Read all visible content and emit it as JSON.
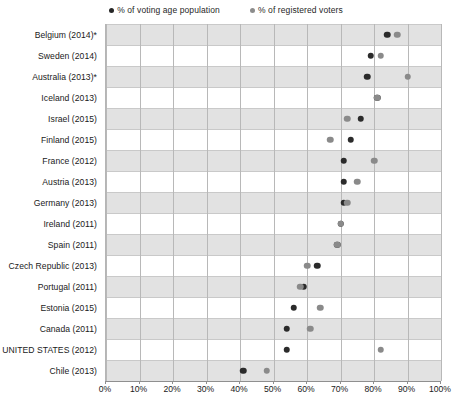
{
  "chart_data": {
    "type": "scatter",
    "title": "",
    "subtitle": "",
    "xlabel": "",
    "ylabel": "",
    "xlim": [
      0,
      100
    ],
    "xticks": [
      "0%",
      "10%",
      "20%",
      "30%",
      "40%",
      "50%",
      "60%",
      "70%",
      "80%",
      "90%",
      "100%"
    ],
    "xtick_values": [
      0,
      10,
      20,
      30,
      40,
      50,
      60,
      70,
      80,
      90,
      100
    ],
    "grid": "vertical",
    "legend_position": "top-center",
    "legend": [
      {
        "name": "% of voting age population",
        "key": "vap",
        "color": "#2b2b2b"
      },
      {
        "name": "% of registered voters",
        "key": "reg",
        "color": "#8a8a8a"
      }
    ],
    "categories": [
      "Belgium (2014)*",
      "Sweden (2014)",
      "Australia (2013)*",
      "Iceland (2013)",
      "Israel (2015)",
      "Finland (2015)",
      "France (2012)",
      "Austria (2013)",
      "Germany (2013)",
      "Ireland (2011)",
      "Spain (2011)",
      "Czech Republic (2013)",
      "Portugal (2011)",
      "Estonia (2015)",
      "Canada (2011)",
      "UNITED STATES (2012)",
      "Chile (2013)"
    ],
    "series": [
      {
        "name": "% of voting age population",
        "key": "vap",
        "color": "#2b2b2b",
        "values": [
          84,
          79,
          78,
          81,
          76,
          73,
          71,
          71,
          71,
          70,
          69,
          63,
          59,
          56,
          54,
          54,
          41
        ]
      },
      {
        "name": "% of registered voters",
        "key": "reg",
        "color": "#8a8a8a",
        "values": [
          87,
          82,
          90,
          81,
          72,
          67,
          80,
          75,
          72,
          70,
          69,
          60,
          58,
          64,
          61,
          82,
          48
        ]
      }
    ]
  }
}
